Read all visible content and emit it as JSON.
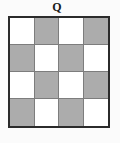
{
  "figure": {
    "label": "Q",
    "colors": {
      "background": "#fbfbfb",
      "light_cell": "#ffffff",
      "dark_cell": "#acacac",
      "outer_border": "#2b2b2b",
      "grid_line": "#7d7d7d",
      "label_text": "#1a1a1a"
    },
    "grid": {
      "rows": 4,
      "columns": 4,
      "pattern_name": "checkerboard",
      "cells": [
        [
          {
            "shade": "light"
          },
          {
            "shade": "dark"
          },
          {
            "shade": "light"
          },
          {
            "shade": "dark"
          }
        ],
        [
          {
            "shade": "dark"
          },
          {
            "shade": "light"
          },
          {
            "shade": "dark"
          },
          {
            "shade": "light"
          }
        ],
        [
          {
            "shade": "light"
          },
          {
            "shade": "dark"
          },
          {
            "shade": "light"
          },
          {
            "shade": "dark"
          }
        ],
        [
          {
            "shade": "dark"
          },
          {
            "shade": "light"
          },
          {
            "shade": "dark"
          },
          {
            "shade": "light"
          }
        ]
      ]
    }
  }
}
